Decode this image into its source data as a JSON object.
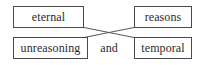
{
  "diagram": {
    "type": "crossed-pair-diagram",
    "background_color": "#ffffff",
    "box_border_color": "#4a4a4a",
    "text_color": "#2b2b2b",
    "connector_color": "#555555",
    "nodes": [
      {
        "id": "eternal",
        "label": "eternal",
        "position": "top-left"
      },
      {
        "id": "reasons",
        "label": "reasons",
        "position": "top-right"
      },
      {
        "id": "unreasoning",
        "label": "unreasoning",
        "position": "bottom-left"
      },
      {
        "id": "temporal",
        "label": "temporal",
        "position": "bottom-right"
      }
    ],
    "connectors": [
      {
        "id": "eternal-to-temporal",
        "from": "eternal",
        "to": "temporal"
      },
      {
        "id": "unreasoning-to-reasons",
        "from": "unreasoning",
        "to": "reasons"
      }
    ],
    "middle_label": "and"
  }
}
